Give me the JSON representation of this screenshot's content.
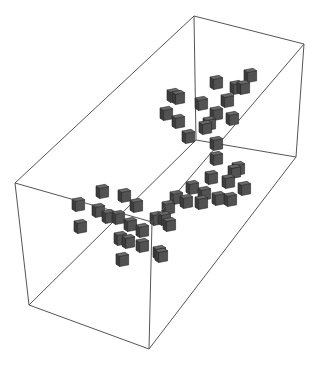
{
  "figure": {
    "type": "3d-voxel-plot",
    "description": "Wireframe bounding box containing two clusters of gray cubes (voxels)",
    "colors": {
      "background": "#ffffff",
      "box_edge": "#555555",
      "cube_top": "#6a6a6a",
      "cube_left": "#3c3c3c",
      "cube_right": "#525252",
      "cube_outline": "#222222"
    },
    "box": {
      "vertices": {
        "A": [
          194,
          16
        ],
        "B": [
          304,
          44
        ],
        "C": [
          15,
          183
        ],
        "G": [
          152,
          222
        ],
        "A2": [
          196,
          140
        ],
        "B2": [
          296,
          157
        ],
        "C2": [
          29,
          305
        ],
        "G2": [
          149,
          349
        ]
      },
      "edges": [
        [
          "A",
          "B"
        ],
        [
          "A",
          "C"
        ],
        [
          "B",
          "G"
        ],
        [
          "C",
          "G"
        ],
        [
          "A2",
          "B2"
        ],
        [
          "A2",
          "C2"
        ],
        [
          "B2",
          "G2"
        ],
        [
          "C2",
          "G2"
        ],
        [
          "A",
          "A2"
        ],
        [
          "B",
          "B2"
        ],
        [
          "C",
          "C2"
        ],
        [
          "G",
          "G2"
        ]
      ]
    },
    "cube_size": 12,
    "cubes": [
      [
        244,
        70
      ],
      [
        210,
        77
      ],
      [
        230,
        82
      ],
      [
        237,
        82
      ],
      [
        221,
        95
      ],
      [
        167,
        90
      ],
      [
        172,
        92
      ],
      [
        160,
        108
      ],
      [
        195,
        98
      ],
      [
        210,
        108
      ],
      [
        226,
        113
      ],
      [
        172,
        116
      ],
      [
        203,
        118
      ],
      [
        199,
        122
      ],
      [
        182,
        131
      ],
      [
        210,
        138
      ],
      [
        210,
        153
      ],
      [
        232,
        163
      ],
      [
        228,
        166
      ],
      [
        205,
        172
      ],
      [
        222,
        176
      ],
      [
        238,
        183
      ],
      [
        186,
        182
      ],
      [
        198,
        188
      ],
      [
        212,
        193
      ],
      [
        224,
        194
      ],
      [
        195,
        197
      ],
      [
        170,
        192
      ],
      [
        180,
        196
      ],
      [
        162,
        202
      ],
      [
        96,
        186
      ],
      [
        118,
        190
      ],
      [
        130,
        200
      ],
      [
        72,
        199
      ],
      [
        92,
        205
      ],
      [
        102,
        211
      ],
      [
        112,
        212
      ],
      [
        124,
        219
      ],
      [
        136,
        225
      ],
      [
        74,
        221
      ],
      [
        150,
        213
      ],
      [
        158,
        213
      ],
      [
        163,
        219
      ],
      [
        114,
        233
      ],
      [
        122,
        236
      ],
      [
        136,
        240
      ],
      [
        153,
        247
      ],
      [
        116,
        254
      ],
      [
        155,
        250
      ]
    ]
  }
}
